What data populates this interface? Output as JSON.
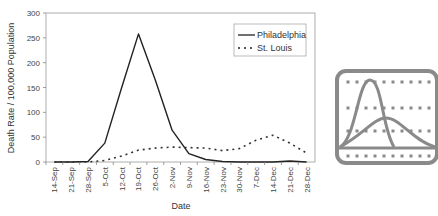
{
  "chart_data": {
    "type": "line",
    "title": "",
    "xlabel": "Date",
    "ylabel": "Death Rate / 100,000 Population",
    "ylim": [
      0,
      300
    ],
    "yticks": [
      0,
      50,
      100,
      150,
      200,
      250,
      300
    ],
    "grid": false,
    "legend_position": "upper right",
    "categories": [
      "14-Sep",
      "21-Sep",
      "28-Sep",
      "5-Oct",
      "12-Oct",
      "19-Oct",
      "26-Oct",
      "2-Nov",
      "9-Nov",
      "16-Nov",
      "23-Nov",
      "30-Nov",
      "7-Dec",
      "14-Dec",
      "21-Dec",
      "28-Dec"
    ],
    "series": [
      {
        "name": "Philadelphia",
        "style": "solid",
        "color": "#222222",
        "values": [
          0,
          0,
          1,
          38,
          150,
          258,
          165,
          64,
          17,
          5,
          1,
          0,
          0,
          0,
          2,
          0
        ]
      },
      {
        "name": "St. Louis",
        "style": "dotted",
        "color": "#333333",
        "values": [
          0,
          0,
          0,
          3,
          12,
          24,
          28,
          30,
          29,
          28,
          23,
          27,
          44,
          54,
          38,
          18
        ]
      }
    ]
  },
  "legend": {
    "items": [
      {
        "label": "Philadelphia"
      },
      {
        "label": "St. Louis"
      }
    ]
  },
  "icon": {
    "name": "epidemic-curves-icon"
  }
}
